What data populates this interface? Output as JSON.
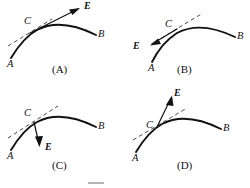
{
  "figure": {
    "stroke_color": "#111111",
    "tangent_color": "#4a4a4a",
    "background": "#ffffff"
  },
  "panels": [
    {
      "id": "A",
      "caption": "(A)",
      "labels": {
        "start": "A",
        "point": "C",
        "end": "B",
        "vector": "E"
      },
      "vector_direction": "up-right along the tangent line at C",
      "tangent_shown": true
    },
    {
      "id": "B",
      "caption": "(B)",
      "labels": {
        "start": "A",
        "point": "C",
        "end": "B",
        "vector": "E"
      },
      "vector_direction": "down-left, opposite to the tangent direction at C",
      "tangent_shown": true
    },
    {
      "id": "C",
      "caption": "(C)",
      "labels": {
        "start": "A",
        "point": "C",
        "end": "B",
        "vector": "E"
      },
      "vector_direction": "downward into the concave side of the curve at C",
      "tangent_shown": true
    },
    {
      "id": "D",
      "caption": "(D)",
      "labels": {
        "start": "A",
        "point": "C",
        "end": "B",
        "vector": "E"
      },
      "vector_direction": "steeply upward, outward from the curve at C",
      "tangent_shown": true
    }
  ]
}
